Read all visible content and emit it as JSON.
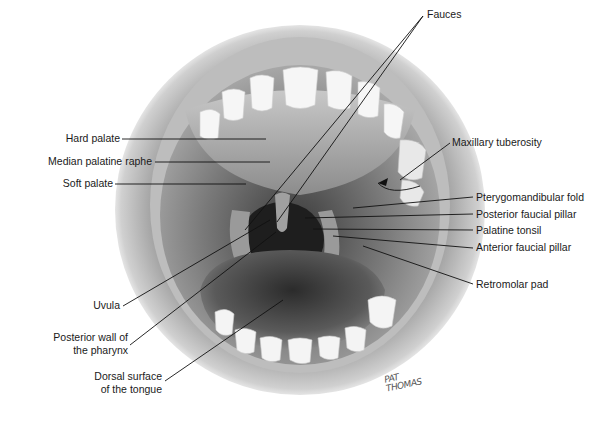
{
  "diagram": {
    "colors": {
      "background": "#ffffff",
      "lines": "#111111",
      "text": "#1a1a1a"
    },
    "labels_left": [
      {
        "id": "hard-palate",
        "text": "Hard palate"
      },
      {
        "id": "median-palatine-raphe",
        "text": "Median palatine raphe"
      },
      {
        "id": "soft-palate",
        "text": "Soft palate"
      },
      {
        "id": "uvula",
        "text": "Uvula"
      },
      {
        "id": "posterior-wall-pharynx",
        "text": "Posterior wall of",
        "text2": "the pharynx"
      },
      {
        "id": "dorsal-surface-tongue",
        "text": "Dorsal surface",
        "text2": "of the tongue"
      }
    ],
    "labels_right": [
      {
        "id": "fauces",
        "text": "Fauces"
      },
      {
        "id": "maxillary-tuberosity",
        "text": "Maxillary tuberosity"
      },
      {
        "id": "pterygomandibular-fold",
        "text": "Pterygomandibular fold"
      },
      {
        "id": "posterior-faucial-pillar",
        "text": "Posterior faucial pillar"
      },
      {
        "id": "palatine-tonsil",
        "text": "Palatine tonsil"
      },
      {
        "id": "anterior-faucial-pillar",
        "text": "Anterior faucial pillar"
      },
      {
        "id": "retromolar-pad",
        "text": "Retromolar pad"
      }
    ],
    "signature": {
      "line1": "PAT",
      "line2": "THOMAS"
    }
  }
}
